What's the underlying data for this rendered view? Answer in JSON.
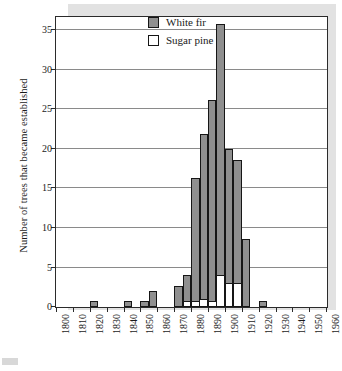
{
  "chart_data": {
    "type": "bar",
    "title": "",
    "subtitle": "",
    "xlabel": "",
    "ylabel": "Number of trees that became established",
    "xlim": [
      1800,
      1960
    ],
    "ylim": [
      0,
      36.5
    ],
    "yticks": [
      0,
      5,
      10,
      15,
      20,
      25,
      30,
      35
    ],
    "xticks": [
      1800,
      1810,
      1820,
      1830,
      1840,
      1850,
      1860,
      1870,
      1880,
      1890,
      1900,
      1910,
      1920,
      1930,
      1940,
      1950,
      1960
    ],
    "grid": "horizontal",
    "stacked": true,
    "bin_width_years": 5,
    "legend_position": "top-right",
    "legend": [
      "White fir",
      "Sugar pine"
    ],
    "categories": [
      1820,
      1840,
      1850,
      1855,
      1870,
      1875,
      1880,
      1885,
      1890,
      1895,
      1900,
      1905,
      1910,
      1920
    ],
    "series": [
      {
        "name": "White fir",
        "color": "#8f8f8f",
        "values": [
          0.8,
          0.8,
          0.8,
          2.0,
          2.7,
          3.2,
          15.5,
          20.8,
          25.3,
          31.7,
          17.0,
          15.6,
          8.6,
          0.8
        ]
      },
      {
        "name": "Sugar pine",
        "color": "#ffffff",
        "values": [
          0,
          0,
          0,
          0,
          0,
          0.8,
          0.8,
          1.0,
          0.8,
          4.0,
          3.0,
          3.0,
          0,
          0
        ]
      }
    ],
    "totals": [
      0.8,
      0.8,
      0.8,
      2.0,
      2.7,
      4.0,
      16.3,
      21.8,
      26.1,
      35.7,
      20.0,
      18.6,
      8.6,
      0.8
    ],
    "annotations": []
  },
  "legend": {
    "items": [
      {
        "label": "White fir",
        "swatch": "gray-filled-square"
      },
      {
        "label": "Sugar pine",
        "swatch": "white-empty-square"
      }
    ]
  },
  "axes": {
    "y_title": "Number of trees that became established",
    "y_tick_labels": [
      "0",
      "5",
      "10",
      "15",
      "20",
      "25",
      "30",
      "35"
    ],
    "x_tick_labels": [
      "1800",
      "1810",
      "1820",
      "1830",
      "1840",
      "1850",
      "1860",
      "1870",
      "1880",
      "1890",
      "1900",
      "1910",
      "1920",
      "1930",
      "1940",
      "1950",
      "1960"
    ]
  },
  "colors": {
    "bar_fir": "#8f8f8f",
    "bar_pine": "#ffffff",
    "bar_outline": "#161616",
    "gridline": "#8a8a8a",
    "frame": "#2b2b2b",
    "shadow_panel": "#e2e2e2",
    "text": "#1a1a1a"
  }
}
